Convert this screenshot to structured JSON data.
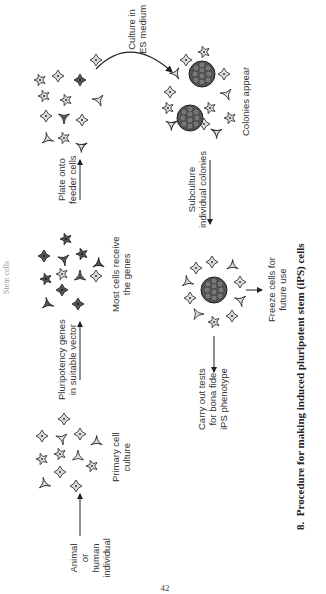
{
  "header": {
    "running_title": "Stem cells"
  },
  "diagram": {
    "title": "Procedure for making induced pluripotent stem (iPS) cells",
    "steps": [
      {
        "id": "source",
        "label": "Animal or human individual"
      },
      {
        "id": "primary",
        "label_line1": "Primary cell",
        "label_line2": "culture"
      },
      {
        "id": "transfect_arrow",
        "label_line1": "Pluripotency genes",
        "label_line2": "in suitable vector"
      },
      {
        "id": "most_cells",
        "label_line1": "Most cells receive",
        "label_line2": "the genes"
      },
      {
        "id": "plate_arrow",
        "label_line1": "Plate onto",
        "label_line2": "feeder cells"
      },
      {
        "id": "culture_arrow",
        "label_line1": "Culture in",
        "label_line2": "ES medium"
      },
      {
        "id": "colonies",
        "label": "Colonies appear"
      },
      {
        "id": "subculture_arrow",
        "label_line1": "Subculture",
        "label_line2": "individual colonies"
      },
      {
        "id": "tests",
        "label_line1": "Carry out tests",
        "label_line2": "for bona fide",
        "label_line3": "iPS phenotype"
      },
      {
        "id": "freeze",
        "label_line1": "Freeze cells for",
        "label_line2": "future use"
      }
    ]
  },
  "caption": {
    "number": "8.",
    "text": "Procedure for making induced pluripotent stem (iPS) cells"
  },
  "page_number": "42",
  "colors": {
    "ink": "#222222",
    "cell_fill_light": "#d8d8d8",
    "cell_fill_dark": "#555555",
    "colony": "#444444"
  }
}
